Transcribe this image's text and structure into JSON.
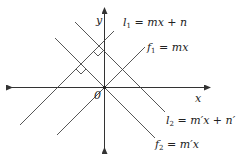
{
  "diagram": {
    "axes": {
      "x_label": "x",
      "y_label": "y",
      "origin_label": "0"
    },
    "lines": [
      {
        "id": "l1",
        "name": "l",
        "sub": "1",
        "rest": " = mx + n",
        "slope": "m",
        "intercept": "n"
      },
      {
        "id": "f1",
        "name": "f",
        "sub": "1",
        "rest": " = mx",
        "slope": "m",
        "intercept": "0"
      },
      {
        "id": "l2",
        "name": "l",
        "sub": "2",
        "rest": " = m′x + n′",
        "slope": "m'",
        "intercept": "n'"
      },
      {
        "id": "f2",
        "name": "f",
        "sub": "2",
        "rest": " = m′x",
        "slope": "m'",
        "intercept": "0"
      }
    ],
    "right_angles": [
      {
        "between": [
          "l1",
          "l2"
        ]
      },
      {
        "between": [
          "l1",
          "f2"
        ]
      }
    ]
  }
}
